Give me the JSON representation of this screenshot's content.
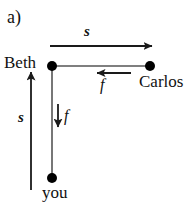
{
  "figure": {
    "panel_label": "a)",
    "width": 195,
    "height": 205,
    "background_color": "#ffffff",
    "stroke_color": "#1a1a1a",
    "node_color": "#000000"
  },
  "nodes": [
    {
      "id": "beth",
      "label": "Beth",
      "x": 52,
      "y": 66,
      "radius": 5
    },
    {
      "id": "carlos",
      "label": "Carlos",
      "x": 150,
      "y": 66,
      "radius": 5
    },
    {
      "id": "you",
      "label": "you",
      "x": 52,
      "y": 178,
      "radius": 5
    }
  ],
  "connectors": [
    {
      "id": "beth-carlos-link",
      "from": "beth",
      "to": "carlos",
      "orientation": "horizontal"
    },
    {
      "id": "beth-you-link",
      "from": "beth",
      "to": "you",
      "orientation": "vertical"
    }
  ],
  "vectors": [
    {
      "id": "displacement-top",
      "symbol": "s",
      "quantity": "displacement",
      "direction": "right",
      "x1": 50,
      "y1": 46,
      "x2": 158,
      "y2": 46
    },
    {
      "id": "displacement-left",
      "symbol": "s",
      "quantity": "displacement",
      "direction": "up",
      "x1": 31,
      "y1": 190,
      "x2": 31,
      "y2": 66
    },
    {
      "id": "force-horizontal",
      "symbol": "f",
      "quantity": "force",
      "direction": "left",
      "x1": 131,
      "y1": 73,
      "x2": 91,
      "y2": 73
    },
    {
      "id": "force-vertical",
      "symbol": "f",
      "quantity": "force",
      "direction": "down",
      "x1": 58,
      "y1": 104,
      "x2": 58,
      "y2": 133
    }
  ]
}
